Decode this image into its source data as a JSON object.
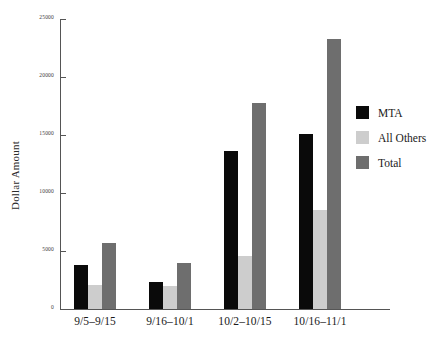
{
  "chart_data": {
    "type": "bar",
    "title": "",
    "xlabel": "",
    "ylabel": "Dollar Amount",
    "ylim": [
      0,
      25000
    ],
    "grid": false,
    "legend_position": "right",
    "categories": [
      "9/5–9/15",
      "9/16–10/1",
      "10/2–10/15",
      "10/16–11/1"
    ],
    "ytick_labels": [
      "0",
      "5000",
      "10000",
      "15000",
      "20000",
      "25000"
    ],
    "ytick_values": [
      0,
      5000,
      10000,
      15000,
      20000,
      25000
    ],
    "series": [
      {
        "name": "MTA",
        "color": "#0a0a0a",
        "values": [
          3800,
          2300,
          13600,
          15100
        ]
      },
      {
        "name": "All Others",
        "color": "#cdcdcd",
        "values": [
          2100,
          2000,
          4600,
          8500
        ]
      },
      {
        "name": "Total",
        "color": "#6e6e6e",
        "values": [
          5700,
          4000,
          17800,
          23300
        ]
      }
    ]
  },
  "axis": {
    "y_title": "Dollar Amount"
  },
  "legend": {
    "items": [
      {
        "label": "MTA",
        "color": "#0a0a0a"
      },
      {
        "label": "All Others",
        "color": "#cdcdcd"
      },
      {
        "label": "Total",
        "color": "#6e6e6e"
      }
    ]
  }
}
